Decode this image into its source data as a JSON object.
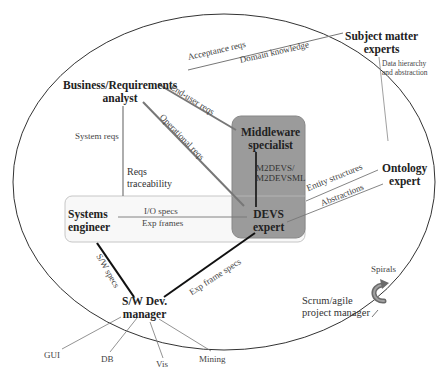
{
  "diagram": {
    "type": "stakeholder-interaction-diagram",
    "boundary": "ellipse",
    "roles": {
      "subject_matter_experts": {
        "line1": "Subject matter",
        "line2": "experts"
      },
      "business_analyst": {
        "line1": "Business/Requirements",
        "line2": "analyst"
      },
      "middleware_specialist": {
        "line1": "Middleware",
        "line2": "specialist"
      },
      "ontology_expert": {
        "line1": "Ontology",
        "line2": "expert"
      },
      "systems_engineer": {
        "line1": "Systems",
        "line2": "engineer"
      },
      "devs_expert": {
        "line1": "DEVS",
        "line2": "expert"
      },
      "sw_dev_manager": {
        "line1": "S/W Dev.",
        "line2": "manager"
      },
      "scrum_manager": {
        "line1": "Scrum/agile",
        "line2": "project manager"
      }
    },
    "edge_labels": {
      "acceptance_reqs": "Acceptance reqs",
      "domain_knowledge": "Domain knowledge",
      "data_hierarchy_1": "Data hierarchy",
      "data_hierarchy_2": "and abstraction",
      "end_user_reqs": "End-user reqs",
      "operational_reqs": "Operational reqs",
      "system_reqs": "System reqs",
      "reqs_traceability_1": "Reqs",
      "reqs_traceability_2": "traceability",
      "m2devs_1": "M2DEVS/",
      "m2devs_2": "M2DEVSML",
      "entity_structures": "Entity structures",
      "abstractions": "Abstractions",
      "io_specs": "I/O specs",
      "exp_frames": "Exp frames",
      "sw_specs": "S/W specs",
      "exp_frame_specs": "Exp frame specs",
      "spirals": "Spirals"
    },
    "outputs": {
      "gui": "GUI",
      "db": "DB",
      "vis": "Vis",
      "mining": "Mining"
    },
    "colors": {
      "middleware_box": "#9b9b9b",
      "systems_box": "#f7f7f7",
      "box_border": "#bdbdbd",
      "line_gray": "#777777",
      "line_dark": "#111111"
    }
  }
}
